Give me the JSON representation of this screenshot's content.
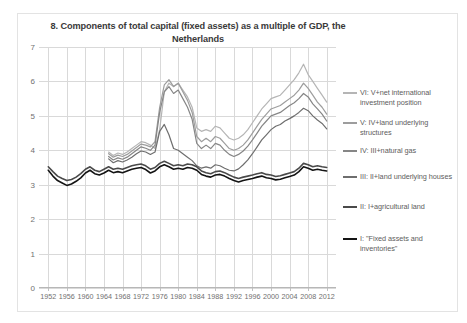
{
  "chart_data": {
    "type": "line",
    "title": "8. Components of total capital (fixed assets) as a multiple of GDP, the Netherlands",
    "xlabel": "",
    "ylabel": "",
    "xlim": [
      1950,
      2014
    ],
    "ylim": [
      0,
      7
    ],
    "grid": true,
    "legend_position": "right",
    "y_ticks": [
      "0",
      "1",
      "2",
      "3",
      "4",
      "5",
      "6",
      "7"
    ],
    "x_ticks": [
      "1952",
      "1956",
      "1960",
      "1964",
      "1968",
      "1972",
      "1976",
      "1980",
      "1984",
      "1988",
      "1992",
      "1996",
      "2000",
      "2004",
      "2008",
      "2012"
    ],
    "colors": {
      "VI": "#b5b5b5",
      "V": "#9d9d9d",
      "IV": "#868686",
      "III": "#6e6e6e",
      "II": "#4a4a4a",
      "I": "#141414"
    },
    "series": [
      {
        "name": "VI: V+net international investment position",
        "key": "VI",
        "color": "#b5b5b5",
        "x": [
          1965,
          1966,
          1967,
          1968,
          1969,
          1970,
          1971,
          1972,
          1973,
          1974,
          1975,
          1976,
          1977,
          1978,
          1979,
          1980,
          1981,
          1982,
          1983,
          1984,
          1985,
          1986,
          1987,
          1988,
          1989,
          1990,
          1991,
          1992,
          1993,
          1994,
          1995,
          1996,
          1997,
          1998,
          1999,
          2000,
          2001,
          2002,
          2003,
          2004,
          2005,
          2006,
          2007,
          2008,
          2009,
          2010,
          2011,
          2012
        ],
        "values": [
          3.95,
          3.85,
          3.92,
          3.88,
          3.95,
          4.05,
          4.15,
          4.25,
          4.22,
          4.15,
          4.05,
          4.6,
          5.7,
          5.95,
          5.85,
          5.95,
          5.75,
          5.55,
          5.25,
          4.65,
          4.55,
          4.6,
          4.55,
          4.7,
          4.65,
          4.5,
          4.35,
          4.3,
          4.35,
          4.45,
          4.6,
          4.8,
          5.0,
          5.2,
          5.35,
          5.5,
          5.55,
          5.6,
          5.75,
          5.9,
          6.05,
          6.25,
          6.5,
          6.2,
          6.0,
          5.8,
          5.6,
          5.4
        ]
      },
      {
        "name": "V: IV+land underlying structures",
        "key": "V",
        "color": "#9d9d9d",
        "x": [
          1965,
          1966,
          1967,
          1968,
          1969,
          1970,
          1971,
          1972,
          1973,
          1974,
          1975,
          1976,
          1977,
          1978,
          1979,
          1980,
          1981,
          1982,
          1983,
          1984,
          1985,
          1986,
          1987,
          1988,
          1989,
          1990,
          1991,
          1992,
          1993,
          1994,
          1995,
          1996,
          1997,
          1998,
          1999,
          2000,
          2001,
          2002,
          2003,
          2004,
          2005,
          2006,
          2007,
          2008,
          2009,
          2010,
          2011,
          2012
        ],
        "values": [
          3.9,
          3.8,
          3.86,
          3.82,
          3.88,
          3.98,
          4.08,
          4.18,
          4.15,
          4.1,
          4.25,
          5.25,
          5.9,
          6.05,
          5.85,
          5.95,
          5.7,
          5.45,
          5.1,
          4.4,
          4.25,
          4.35,
          4.25,
          4.4,
          4.35,
          4.2,
          4.05,
          4.0,
          4.05,
          4.15,
          4.3,
          4.5,
          4.7,
          4.9,
          5.05,
          5.2,
          5.25,
          5.3,
          5.4,
          5.5,
          5.6,
          5.75,
          5.95,
          5.8,
          5.6,
          5.4,
          5.25,
          5.05
        ]
      },
      {
        "name": "IV: III+natural gas",
        "key": "IV",
        "color": "#868686",
        "x": [
          1965,
          1966,
          1967,
          1968,
          1969,
          1970,
          1971,
          1972,
          1973,
          1974,
          1975,
          1976,
          1977,
          1978,
          1979,
          1980,
          1981,
          1982,
          1983,
          1984,
          1985,
          1986,
          1987,
          1988,
          1989,
          1990,
          1991,
          1992,
          1993,
          1994,
          1995,
          1996,
          1997,
          1998,
          1999,
          2000,
          2001,
          2002,
          2003,
          2004,
          2005,
          2006,
          2007,
          2008,
          2009,
          2010,
          2011,
          2012
        ],
        "values": [
          3.82,
          3.72,
          3.78,
          3.74,
          3.8,
          3.9,
          4.0,
          4.1,
          4.06,
          4.0,
          4.15,
          5.1,
          5.7,
          5.85,
          5.65,
          5.75,
          5.5,
          5.25,
          4.9,
          4.2,
          4.05,
          4.15,
          4.05,
          4.2,
          4.15,
          4.0,
          3.88,
          3.82,
          3.88,
          3.98,
          4.12,
          4.3,
          4.5,
          4.7,
          4.85,
          5.0,
          5.05,
          5.1,
          5.2,
          5.3,
          5.38,
          5.5,
          5.65,
          5.55,
          5.35,
          5.2,
          5.05,
          4.85
        ]
      },
      {
        "name": "III: II+land underlying houses",
        "key": "III",
        "color": "#6e6e6e",
        "x": [
          1965,
          1966,
          1967,
          1968,
          1969,
          1970,
          1971,
          1972,
          1973,
          1974,
          1975,
          1976,
          1977,
          1978,
          1979,
          1980,
          1981,
          1982,
          1983,
          1984,
          1985,
          1986,
          1987,
          1988,
          1989,
          1990,
          1991,
          1992,
          1993,
          1994,
          1995,
          1996,
          1997,
          1998,
          1999,
          2000,
          2001,
          2002,
          2003,
          2004,
          2005,
          2006,
          2007,
          2008,
          2009,
          2010,
          2011,
          2012
        ],
        "values": [
          3.75,
          3.64,
          3.7,
          3.66,
          3.72,
          3.8,
          3.9,
          3.98,
          3.95,
          3.88,
          3.95,
          4.55,
          4.75,
          4.45,
          4.05,
          4.0,
          3.9,
          3.8,
          3.7,
          3.55,
          3.48,
          3.52,
          3.48,
          3.58,
          3.55,
          3.48,
          3.42,
          3.4,
          3.46,
          3.58,
          3.72,
          3.9,
          4.1,
          4.3,
          4.45,
          4.6,
          4.7,
          4.75,
          4.85,
          4.92,
          5.0,
          5.1,
          5.22,
          5.15,
          5.0,
          4.88,
          4.78,
          4.62
        ]
      },
      {
        "name": "II: I+agricultural land",
        "key": "II",
        "color": "#4a4a4a",
        "x": [
          1952,
          1953,
          1954,
          1955,
          1956,
          1957,
          1958,
          1959,
          1960,
          1961,
          1962,
          1963,
          1964,
          1965,
          1966,
          1967,
          1968,
          1969,
          1970,
          1971,
          1972,
          1973,
          1974,
          1975,
          1976,
          1977,
          1978,
          1979,
          1980,
          1981,
          1982,
          1983,
          1984,
          1985,
          1986,
          1987,
          1988,
          1989,
          1990,
          1991,
          1992,
          1993,
          1994,
          1995,
          1996,
          1997,
          1998,
          1999,
          2000,
          2001,
          2002,
          2003,
          2004,
          2005,
          2006,
          2007,
          2008,
          2009,
          2010,
          2011,
          2012
        ],
        "values": [
          3.52,
          3.38,
          3.25,
          3.18,
          3.12,
          3.15,
          3.22,
          3.32,
          3.45,
          3.52,
          3.42,
          3.38,
          3.45,
          3.52,
          3.45,
          3.48,
          3.45,
          3.5,
          3.55,
          3.58,
          3.6,
          3.55,
          3.45,
          3.5,
          3.62,
          3.68,
          3.62,
          3.55,
          3.58,
          3.55,
          3.6,
          3.58,
          3.52,
          3.4,
          3.35,
          3.32,
          3.38,
          3.4,
          3.35,
          3.28,
          3.22,
          3.18,
          3.22,
          3.25,
          3.28,
          3.32,
          3.35,
          3.3,
          3.28,
          3.24,
          3.26,
          3.3,
          3.34,
          3.38,
          3.48,
          3.62,
          3.58,
          3.52,
          3.55,
          3.52,
          3.5
        ]
      },
      {
        "name": "I: \"Fixed assets and inventories\"",
        "key": "I",
        "color": "#141414",
        "x": [
          1952,
          1953,
          1954,
          1955,
          1956,
          1957,
          1958,
          1959,
          1960,
          1961,
          1962,
          1963,
          1964,
          1965,
          1966,
          1967,
          1968,
          1969,
          1970,
          1971,
          1972,
          1973,
          1974,
          1975,
          1976,
          1977,
          1978,
          1979,
          1980,
          1981,
          1982,
          1983,
          1984,
          1985,
          1986,
          1987,
          1988,
          1989,
          1990,
          1991,
          1992,
          1993,
          1994,
          1995,
          1996,
          1997,
          1998,
          1999,
          2000,
          2001,
          2002,
          2003,
          2004,
          2005,
          2006,
          2007,
          2008,
          2009,
          2010,
          2011,
          2012
        ],
        "values": [
          3.42,
          3.25,
          3.12,
          3.05,
          2.98,
          3.02,
          3.1,
          3.2,
          3.34,
          3.42,
          3.32,
          3.28,
          3.34,
          3.42,
          3.35,
          3.38,
          3.35,
          3.4,
          3.45,
          3.48,
          3.5,
          3.44,
          3.34,
          3.4,
          3.52,
          3.58,
          3.52,
          3.45,
          3.48,
          3.45,
          3.5,
          3.48,
          3.42,
          3.3,
          3.25,
          3.22,
          3.28,
          3.3,
          3.25,
          3.18,
          3.12,
          3.08,
          3.12,
          3.15,
          3.18,
          3.22,
          3.25,
          3.2,
          3.18,
          3.14,
          3.16,
          3.2,
          3.24,
          3.28,
          3.38,
          3.52,
          3.48,
          3.42,
          3.45,
          3.42,
          3.4
        ]
      }
    ]
  },
  "legend": {
    "items": [
      {
        "label_line1": "VI: V+net international",
        "label_line2": "investment position",
        "color": "#b5b5b5"
      },
      {
        "label_line1": "V: IV+land underlying",
        "label_line2": "structures",
        "color": "#9d9d9d"
      },
      {
        "label_line1": "IV: III+natural gas",
        "label_line2": "",
        "color": "#868686"
      },
      {
        "label_line1": "III: II+land underlying houses",
        "label_line2": "",
        "color": "#6e6e6e"
      },
      {
        "label_line1": "II: I+agricultural land",
        "label_line2": "",
        "color": "#4a4a4a"
      },
      {
        "label_line1": "I: \"Fixed assets and",
        "label_line2": "inventories\"",
        "color": "#141414"
      }
    ]
  }
}
